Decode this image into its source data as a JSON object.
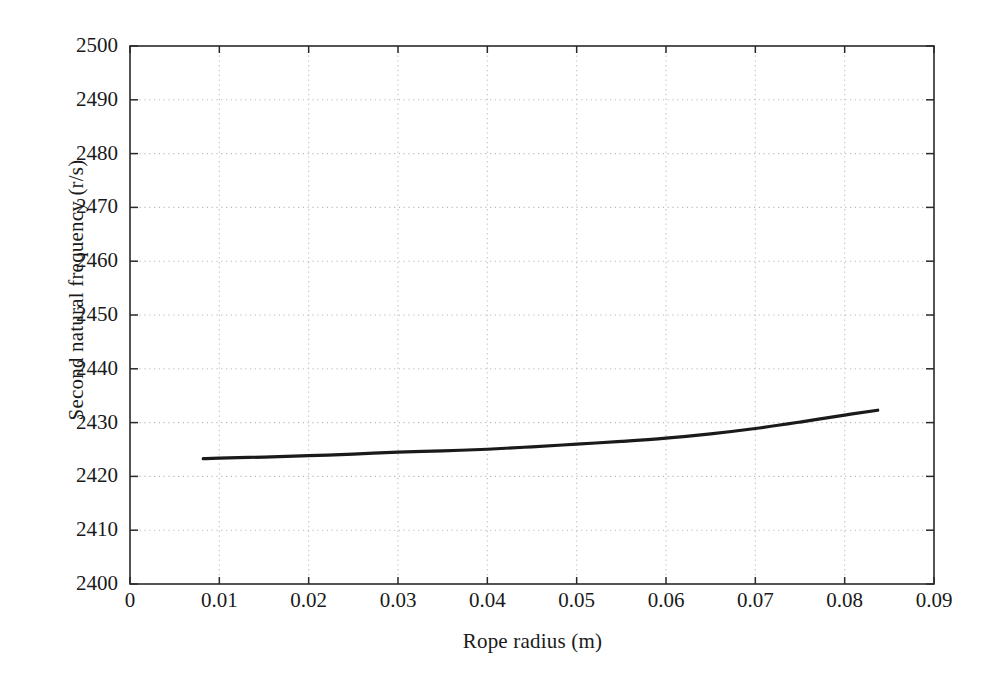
{
  "chart_data": {
    "type": "line",
    "title": "",
    "subtitle": "",
    "xlabel": "Rope radius (m)",
    "ylabel": "Second natural frequency (r/s)",
    "xlim": [
      0,
      0.09
    ],
    "ylim": [
      2400,
      2500
    ],
    "xticks": [
      0,
      0.01,
      0.02,
      0.03,
      0.04,
      0.05,
      0.06,
      0.07,
      0.08,
      0.09
    ],
    "xtick_labels": [
      "0",
      "0.01",
      "0.02",
      "0.03",
      "0.04",
      "0.05",
      "0.06",
      "0.07",
      "0.08",
      "0.09"
    ],
    "yticks": [
      2400,
      2410,
      2420,
      2430,
      2440,
      2450,
      2460,
      2470,
      2480,
      2490,
      2500
    ],
    "ytick_labels": [
      "2400",
      "2410",
      "2420",
      "2430",
      "2440",
      "2450",
      "2460",
      "2470",
      "2480",
      "2490",
      "2500"
    ],
    "grid": true,
    "grid_style": "dotted",
    "grid_color": "#bbbbbb",
    "legend": null,
    "line_color": "#1a1a1a",
    "line_width": 3.2,
    "annotations": [],
    "series": [
      {
        "name": "Second natural frequency vs rope radius",
        "x": [
          0.0082,
          0.01,
          0.015,
          0.02,
          0.025,
          0.03,
          0.035,
          0.04,
          0.045,
          0.05,
          0.055,
          0.06,
          0.065,
          0.07,
          0.075,
          0.08,
          0.0837
        ],
        "y": [
          2423.3,
          2423.4,
          2423.6,
          2423.85,
          2424.15,
          2424.5,
          2424.75,
          2425.05,
          2425.5,
          2426.0,
          2426.5,
          2427.1,
          2427.9,
          2428.9,
          2430.1,
          2431.4,
          2432.3
        ]
      }
    ]
  },
  "axes_geometry": {
    "left_px": 130,
    "right_px": 934,
    "top_px": 46,
    "bottom_px": 584
  }
}
